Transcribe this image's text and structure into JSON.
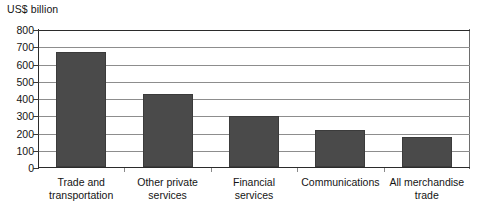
{
  "chart_data": {
    "type": "bar",
    "title": "",
    "subtitle": "",
    "xlabel": "",
    "ylabel": "US$ billion",
    "categories": [
      "Trade and transportation",
      "Other private services",
      "Financial services",
      "Communications",
      "All merchandise trade"
    ],
    "category_lines": [
      [
        "Trade and",
        "transportation"
      ],
      [
        "Other private",
        "services"
      ],
      [
        "Financial",
        "services"
      ],
      [
        "Communications",
        ""
      ],
      [
        "All merchandise",
        "trade"
      ]
    ],
    "values": [
      665,
      425,
      295,
      215,
      175
    ],
    "ylim": [
      0,
      800
    ],
    "ytick_values": [
      0,
      100,
      200,
      300,
      400,
      500,
      600,
      700,
      800
    ],
    "ytick_labels": [
      "0",
      "100",
      "200",
      "300",
      "400",
      "500",
      "600",
      "700",
      "800"
    ],
    "grid": true,
    "grid_axis": "y",
    "legend": false,
    "legend_position": "none",
    "bar_color": "#4a4a4a",
    "bar_edge_color": "#3b3b3b",
    "gridline_color": "#8d8d8d",
    "axis_color": "#2b2b2b",
    "background_color": "#ffffff",
    "text_color": "#141414"
  },
  "notes": {
    "source_note": ""
  }
}
